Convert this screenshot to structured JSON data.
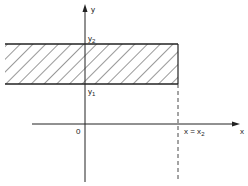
{
  "diagram": {
    "y_axis_label": "y",
    "x_axis_label": "x",
    "origin_label": "0",
    "y2_label": "y",
    "y2_sub": "2",
    "y1_label": "y",
    "y1_sub": "1",
    "x2_label": "x = x",
    "x2_sub": "2"
  }
}
